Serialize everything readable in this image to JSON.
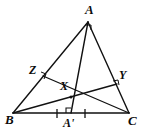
{
  "figure": {
    "type": "geometry-diagram",
    "background_color": "#ffffff",
    "stroke_color": "#111111",
    "points": {
      "A": {
        "label": "A",
        "x": 88,
        "y": 22
      },
      "B": {
        "label": "B",
        "x": 13,
        "y": 113
      },
      "C": {
        "label": "C",
        "x": 129,
        "y": 113
      },
      "X": {
        "label": "X",
        "x": 71,
        "y": 97
      },
      "Y": {
        "label": "Y",
        "x": 117,
        "y": 84
      },
      "Z": {
        "label": "Z",
        "x": 43,
        "y": 76
      },
      "Ap": {
        "label": "A'",
        "x": 71,
        "y": 113
      }
    },
    "segments": [
      {
        "name": "AB",
        "from": "A",
        "to": "B"
      },
      {
        "name": "AC",
        "from": "A",
        "to": "C"
      },
      {
        "name": "BC",
        "from": "B",
        "to": "C"
      },
      {
        "name": "AA-prime",
        "from": "A",
        "to": "Ap"
      },
      {
        "name": "BY",
        "from": "B",
        "to": "Y"
      },
      {
        "name": "CZ",
        "from": "C",
        "to": "Z"
      },
      {
        "name": "ZX",
        "from": "Z",
        "to": "X"
      }
    ],
    "right_angle_marks": [
      {
        "name": "right-angle-at-A-prime",
        "at": "Ap"
      },
      {
        "name": "right-angle-at-Z",
        "at": "Z"
      },
      {
        "name": "right-angle-at-Y",
        "at": "Y"
      },
      {
        "name": "right-angle-at-A",
        "at": "A"
      }
    ],
    "tick_marks": [
      {
        "name": "tick-BA-prime",
        "x": 57,
        "y": 113
      },
      {
        "name": "tick-A-prime-C",
        "x": 85,
        "y": 113
      }
    ]
  }
}
